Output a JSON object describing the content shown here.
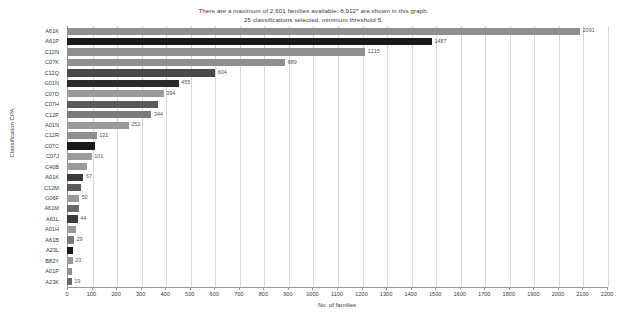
{
  "title": {
    "line1": "There are a maximum of 2,601 families available, 8,912* are shown in this graph.",
    "line2": "25 classifications selected, minimum threshold 5."
  },
  "axes": {
    "xlabel": "No. of families",
    "ylabel": "Classification CPA"
  },
  "chart_data": {
    "type": "bar",
    "orientation": "horizontal",
    "title": "There are a maximum of 2,601 families available, 8,912* are shown in this graph. 25 classifications selected, minimum threshold 5.",
    "xlabel": "No. of families",
    "ylabel": "Classification CPA",
    "xlim": [
      0,
      2200
    ],
    "ylim": null,
    "grid": true,
    "legend": null,
    "xticks": [
      0,
      100,
      200,
      300,
      400,
      500,
      600,
      700,
      800,
      900,
      1000,
      1100,
      1200,
      1300,
      1400,
      1500,
      1600,
      1700,
      1800,
      1900,
      2000,
      2100,
      2200
    ],
    "categories": [
      "A61K",
      "A61P",
      "C12N",
      "C07K",
      "C12Q",
      "G01N",
      "C07D",
      "C07H",
      "C12P",
      "A01N",
      "C12R",
      "C07C",
      "C07J",
      "C40B",
      "A01K",
      "C12M",
      "G06F",
      "A61M",
      "A61L",
      "A01H",
      "A61B",
      "A23L",
      "B82Y",
      "A01P",
      "A23K"
    ],
    "values": [
      2091,
      1487,
      1215,
      889,
      604,
      455,
      394,
      370,
      344,
      252,
      121,
      115,
      101,
      80,
      67,
      58,
      50,
      47,
      44,
      38,
      29,
      26,
      23,
      21,
      19
    ],
    "bar_colors": [
      "#8f8f8f",
      "#1a1a1a",
      "#8f8f8f",
      "#8f8f8f",
      "#4a4a4a",
      "#2a2a2a",
      "#9a9a9a",
      "#5a5a5a",
      "#7a7a7a",
      "#9a9a9a",
      "#8f8f8f",
      "#1a1a1a",
      "#9a9a9a",
      "#9a9a9a",
      "#3a3a3a",
      "#5a5a5a",
      "#9a9a9a",
      "#6a6a6a",
      "#3a3a3a",
      "#9a9a9a",
      "#7a7a7a",
      "#1a1a1a",
      "#9a9a9a",
      "#8f8f8f",
      "#6a6a6a"
    ],
    "value_labels_visible": [
      "2091",
      "1487",
      "1215",
      "889",
      "604",
      "455",
      "394",
      "",
      "344",
      "252",
      "121",
      "",
      "101",
      "",
      "67",
      "",
      "50",
      "",
      "44",
      "",
      "29",
      "",
      "23",
      "",
      "19"
    ]
  }
}
